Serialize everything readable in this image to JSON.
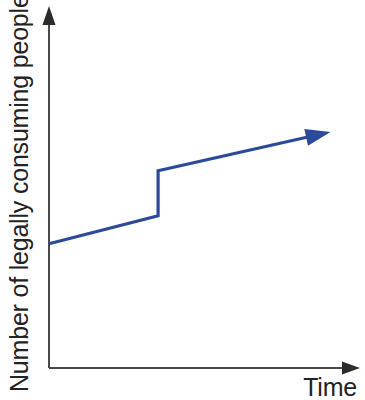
{
  "chart_data": {
    "type": "line",
    "title": "",
    "subtitle": "",
    "xlabel": "Time",
    "ylabel": "Number of legally consuming people",
    "grid": false,
    "legend": null,
    "axes": {
      "x": {
        "ticks": [],
        "tick_labels": [],
        "arrow": true,
        "range_label": "Time"
      },
      "y": {
        "ticks": [],
        "tick_labels": [],
        "arrow": true,
        "range_label": "Number of legally consuming people"
      }
    },
    "annotations": [],
    "series": [
      {
        "name": "Legally consuming people over time",
        "style": "step-with-discontinuity",
        "color": "#2B4A9B",
        "arrow_end": true,
        "points": [
          {
            "x": 0.0,
            "y": 0.345
          },
          {
            "x": 0.353,
            "y": 0.423
          },
          {
            "x": 0.353,
            "y": 0.548
          },
          {
            "x": 0.87,
            "y": 0.648
          }
        ],
        "segments": [
          {
            "label": "gradual rise before policy change",
            "from": {
              "x": 0.0,
              "y": 0.345
            },
            "to": {
              "x": 0.353,
              "y": 0.423
            }
          },
          {
            "label": "instant jump at policy change",
            "from": {
              "x": 0.353,
              "y": 0.423
            },
            "to": {
              "x": 0.353,
              "y": 0.548
            }
          },
          {
            "label": "gradual rise after policy change",
            "from": {
              "x": 0.353,
              "y": 0.548
            },
            "to": {
              "x": 0.87,
              "y": 0.648
            }
          }
        ]
      }
    ]
  },
  "colors": {
    "data_line": "#2B4A9B",
    "axis": "#494949",
    "label_text": "#232323",
    "background": "#ffffff"
  }
}
